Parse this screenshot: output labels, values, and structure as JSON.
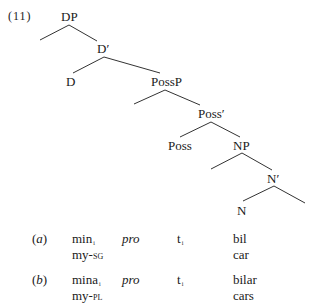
{
  "example_number": "(11)",
  "tree": {
    "nodes": {
      "DP": "DP",
      "D_bar": "D′",
      "D": "D",
      "PossP": "PossP",
      "Poss_bar": "Poss′",
      "Poss": "Poss",
      "NP": "NP",
      "N_bar": "N′",
      "N": "N"
    }
  },
  "glosses": [
    {
      "label": "(a)",
      "det": "min",
      "det_index": "i",
      "gloss_det_base": "my-",
      "gloss_det_feature": "sg",
      "pro": "pro",
      "trace": "t",
      "trace_index": "i",
      "noun": "bil",
      "gloss_noun": "car"
    },
    {
      "label": "(b)",
      "det": "mina",
      "det_index": "i",
      "gloss_det_base": "my-",
      "gloss_det_feature": "pl",
      "pro": "pro",
      "trace": "t",
      "trace_index": "i",
      "noun": "bilar",
      "gloss_noun": "cars"
    }
  ]
}
